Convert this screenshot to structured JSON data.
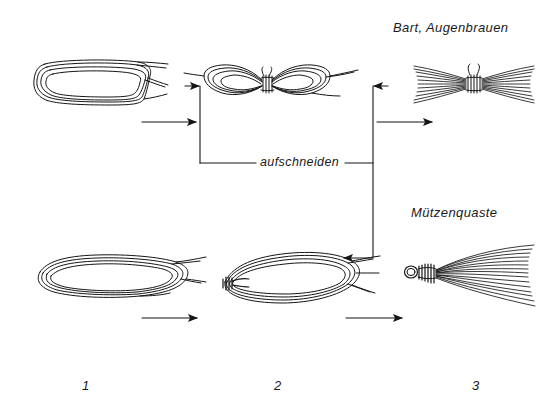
{
  "diagram": {
    "title_top_right": "Bart, Augenbrauen",
    "title_mid_right": "Mützenquaste",
    "cut_label": "aufschneiden",
    "ink_color": "#151515",
    "background_color": "#ffffff",
    "columns": [
      {
        "number": "1"
      },
      {
        "number": "2"
      },
      {
        "number": "3"
      }
    ],
    "rows": [
      {
        "name": "beard-eyebrows",
        "result_label": "Bart, Augenbrauen",
        "steps": [
          {
            "index": "1",
            "shape": "flat-thread-hank-loop"
          },
          {
            "index": "2",
            "shape": "center-tied-bow-hank"
          },
          {
            "index": "3",
            "shape": "double-ended-fiber-brush"
          }
        ]
      },
      {
        "name": "cap-tassel",
        "result_label": "Mützenquaste",
        "steps": [
          {
            "index": "1",
            "shape": "flat-thread-hank-loop"
          },
          {
            "index": "2",
            "shape": "end-tied-oval-hank"
          },
          {
            "index": "3",
            "shape": "wrapped-neck-tassel"
          }
        ]
      }
    ],
    "arrows": [
      {
        "name": "row1-step1-to-step2",
        "direction": "right"
      },
      {
        "name": "row1-step2-to-step3",
        "direction": "right"
      },
      {
        "name": "row2-step1-to-step2",
        "direction": "right"
      },
      {
        "name": "row2-step2-to-step3",
        "direction": "right"
      },
      {
        "name": "cut-bracket-left-arrow",
        "direction": "right"
      },
      {
        "name": "cut-bracket-right-arrow",
        "direction": "left"
      },
      {
        "name": "cut-bracket-bottom-arrow",
        "direction": "left"
      }
    ]
  }
}
